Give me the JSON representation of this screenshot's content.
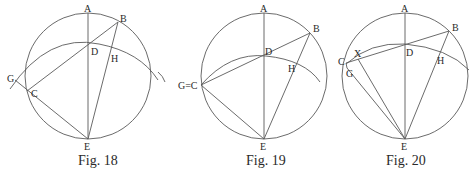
{
  "figures": [
    {
      "caption": "Fig. 18",
      "labels": {
        "A": "A",
        "B": "B",
        "D": "D",
        "H": "H",
        "G": "G",
        "C": "C",
        "E": "E"
      }
    },
    {
      "caption": "Fig. 19",
      "labels": {
        "A": "A",
        "B": "B",
        "D": "D",
        "H": "H",
        "GC": "G=C",
        "E": "E"
      }
    },
    {
      "caption": "Fig. 20",
      "labels": {
        "A": "A",
        "B": "B",
        "D": "D",
        "H": "H",
        "C": "C",
        "X": "X",
        "G": "G",
        "E": "E"
      }
    }
  ],
  "colors": {
    "line": "#5a5a5a",
    "text": "#2a2a2a",
    "background": "#ffffff"
  }
}
